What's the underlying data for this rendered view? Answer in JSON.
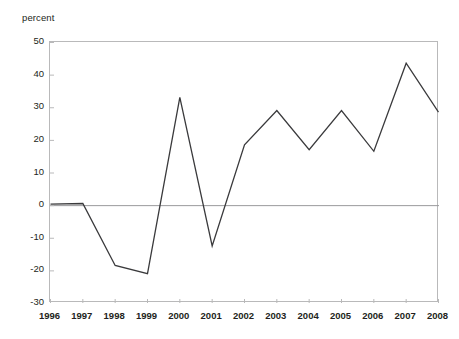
{
  "axis": {
    "y_unit_label": "percent",
    "y_ticks": [
      "50",
      "40",
      "30",
      "20",
      "10",
      "0",
      "-10",
      "-20",
      "-30"
    ],
    "x_ticks": [
      "1996",
      "1997",
      "1998",
      "1999",
      "2000",
      "2001",
      "2002",
      "2003",
      "2004",
      "2005",
      "2006",
      "2007",
      "2008"
    ]
  },
  "style": {
    "line_color": "#3a3a3c",
    "frame_color": "#b9b9ba",
    "zero_line_color": "#9a9a9c",
    "tick_color": "#b9b9ba",
    "background": "#ffffff",
    "text_color": "#231f20"
  },
  "chart_data": {
    "type": "line",
    "title": "",
    "subtitle": "",
    "xlabel": "",
    "ylabel": "percent",
    "x": [
      "1996",
      "1997",
      "1998",
      "1999",
      "2000",
      "2001",
      "2002",
      "2003",
      "2004",
      "2005",
      "2006",
      "2007",
      "2008"
    ],
    "values": [
      0.3,
      0.5,
      -18.5,
      -21.0,
      33.0,
      -12.5,
      18.5,
      29.0,
      17.0,
      29.0,
      16.5,
      43.5,
      28.5
    ],
    "ylim": [
      -30,
      50
    ],
    "ytick_values": [
      50,
      40,
      30,
      20,
      10,
      0,
      -10,
      -20,
      -30
    ],
    "ytick_step": 10,
    "grid": false,
    "zero_line": true,
    "legend": "none",
    "markers": false
  }
}
